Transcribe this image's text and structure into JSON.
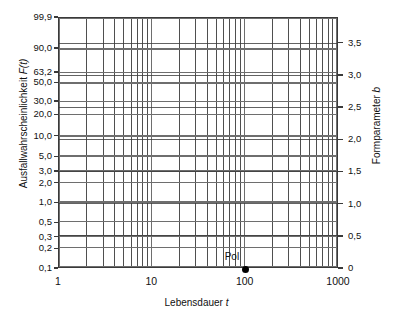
{
  "chart_data": {
    "type": "line",
    "title": "",
    "subtitle": "",
    "xlabel": "Lebensdauer t",
    "ylabel": "Ausfallwahrscheinlichkeit F(t)",
    "y2label": "Formparameter b",
    "xscale": "log",
    "yscale": "weibull",
    "xlim": [
      1,
      1000
    ],
    "x_ticks": [
      "1",
      "10",
      "100",
      "1000"
    ],
    "x_tick_values": [
      1,
      10,
      100,
      1000
    ],
    "y_ticks": [
      "99,9",
      "90,0",
      "63,2",
      "50,0",
      "30,0",
      "20,0",
      "10,0",
      "5,0",
      "3,0",
      "2,0",
      "1,0",
      "0,5",
      "0,3",
      "0,2",
      "0,1"
    ],
    "y_tick_values": [
      99.9,
      90.0,
      63.2,
      50.0,
      30.0,
      20.0,
      10.0,
      5.0,
      3.0,
      2.0,
      1.0,
      0.5,
      0.3,
      0.2,
      0.1
    ],
    "y2_ticks": [
      "3,5",
      "3,0",
      "2,5",
      "2,0",
      "1,5",
      "1,0",
      "0,5",
      "0"
    ],
    "y2_tick_values": [
      3.5,
      3.0,
      2.5,
      2.0,
      1.5,
      1.0,
      0.5,
      0.0
    ],
    "y2lim": [
      0,
      3.9
    ],
    "grid": "on",
    "grid_minor": "on",
    "legend": "none",
    "series": [],
    "annotations": [
      {
        "label": "Pol",
        "x": 100,
        "y": 0.1,
        "marker": "filled-circle",
        "color": "#000000"
      }
    ],
    "colors": {
      "grid_major": "#6e6e6e",
      "grid_minor": "#3a3a3a",
      "frame": "#3a3a3a",
      "text": "#111111",
      "background": "#ffffff",
      "marker": "#000000"
    }
  },
  "axes": {
    "left": {
      "title": "Ausfallwahrscheinlichkeit F(t)",
      "title_main": "Ausfallwahrscheinlichkeit ",
      "title_italic": "F(t)",
      "ticks": [
        "99,9",
        "90,0",
        "63,2",
        "50,0",
        "30,0",
        "20,0",
        "10,0",
        "5,0",
        "3,0",
        "2,0",
        "1,0",
        "0,5",
        "0,3",
        "0,2",
        "0,1"
      ]
    },
    "right": {
      "title": "Formparameter b",
      "title_main": "Formparameter ",
      "title_italic": "b",
      "ticks": [
        "3,5",
        "3,0",
        "2,5",
        "2,0",
        "1,5",
        "1,0",
        "0,5",
        "0"
      ]
    },
    "bottom": {
      "title": "Lebensdauer t",
      "title_main": "Lebensdauer ",
      "title_italic": "t",
      "ticks": [
        "1",
        "10",
        "100",
        "1000"
      ]
    }
  },
  "annotation": {
    "pol_label": "Pol"
  }
}
